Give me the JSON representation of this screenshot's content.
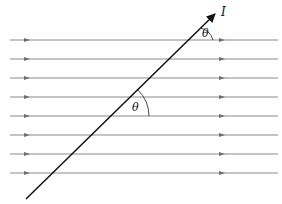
{
  "diagram": {
    "field_lines": {
      "count": 8,
      "y_positions": [
        40,
        59,
        78,
        97,
        116,
        135,
        154,
        173
      ],
      "x_start": 10,
      "x_end": 278,
      "color": "#8a8a8a",
      "arrow_x_left": 27,
      "arrow_x_right": 222
    },
    "wire": {
      "label": "I",
      "x1": 26,
      "y1": 199,
      "x2": 217,
      "y2": 12,
      "color": "#111111"
    },
    "angles": [
      {
        "label": "θ",
        "name": "angle-theta-top"
      },
      {
        "label": "θ",
        "name": "angle-theta-middle"
      }
    ]
  }
}
